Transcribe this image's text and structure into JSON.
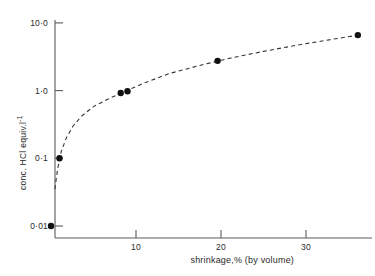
{
  "chart_data": {
    "type": "scatter",
    "title": "",
    "xlabel": "shrinkage,% (by volume)",
    "ylabel": "conc. HCl equiv.l",
    "ylabel_exponent": "-1",
    "yscale": "log",
    "xscale": "linear",
    "xlim": [
      0,
      38
    ],
    "ylim": [
      0.008,
      10.0
    ],
    "grid": false,
    "legend": null,
    "xticks": [
      10,
      20,
      30
    ],
    "xtick_labels": [
      "10",
      "20",
      "30"
    ],
    "yticks": [
      0.01,
      0.1,
      1.0,
      10.0
    ],
    "ytick_labels": [
      "0·01",
      "0·1",
      "1·0",
      "10·0"
    ],
    "series": [
      {
        "name": "measured points",
        "marker": "filled-circle",
        "marker_color": "#111111",
        "points": [
          {
            "x": 0.0,
            "y": 0.01
          },
          {
            "x": 1.0,
            "y": 0.1
          },
          {
            "x": 8.2,
            "y": 0.92
          },
          {
            "x": 9.0,
            "y": 0.98
          },
          {
            "x": 19.6,
            "y": 2.75
          },
          {
            "x": 36.1,
            "y": 6.6
          }
        ]
      },
      {
        "name": "fitted curve",
        "style": "dashed",
        "line_color": "#333333",
        "points": [
          {
            "x": 0.45,
            "y": 0.035
          },
          {
            "x": 0.8,
            "y": 0.072
          },
          {
            "x": 1.2,
            "y": 0.125
          },
          {
            "x": 1.8,
            "y": 0.2
          },
          {
            "x": 2.6,
            "y": 0.3
          },
          {
            "x": 3.6,
            "y": 0.42
          },
          {
            "x": 5.0,
            "y": 0.58
          },
          {
            "x": 6.6,
            "y": 0.74
          },
          {
            "x": 8.5,
            "y": 0.95
          },
          {
            "x": 11.0,
            "y": 1.3
          },
          {
            "x": 14.0,
            "y": 1.8
          },
          {
            "x": 17.5,
            "y": 2.35
          },
          {
            "x": 21.0,
            "y": 3.0
          },
          {
            "x": 25.0,
            "y": 3.8
          },
          {
            "x": 29.0,
            "y": 4.7
          },
          {
            "x": 33.0,
            "y": 5.7
          },
          {
            "x": 36.5,
            "y": 6.7
          }
        ]
      }
    ],
    "axes_geometry": {
      "x_origin_px": 51,
      "x_px_per_unit": 8.5,
      "y_baseline_px": 226,
      "y_px_per_decade": 67.7,
      "axis_left_px": 55,
      "axis_bottom_px": 238,
      "axis_top_px": 20,
      "axis_right_px": 372
    }
  }
}
